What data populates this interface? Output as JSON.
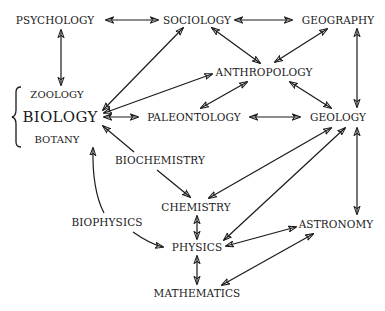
{
  "diagram": {
    "caption_partial": "",
    "nodes": [
      {
        "id": "psychology",
        "label": "PSYCHOLOGY",
        "x": 55,
        "y": 20
      },
      {
        "id": "sociology",
        "label": "SOCIOLOGY",
        "x": 214,
        "y": 20
      },
      {
        "id": "geography",
        "label": "GEOGRAPHY",
        "x": 346,
        "y": 20
      },
      {
        "id": "anthropology",
        "label": "ANTHROPOLOGY",
        "x": 278,
        "y": 72
      },
      {
        "id": "zoology",
        "label": "ZOOLOGY",
        "x": 60,
        "y": 95
      },
      {
        "id": "biology",
        "label": "BIOLOGY",
        "x": 60,
        "y": 117
      },
      {
        "id": "botany",
        "label": "BOTANY",
        "x": 60,
        "y": 139
      },
      {
        "id": "paleontology",
        "label": "PALEONTOLOGY",
        "x": 218,
        "y": 117
      },
      {
        "id": "geology",
        "label": "GEOLOGY",
        "x": 355,
        "y": 117
      },
      {
        "id": "biochemistry",
        "label": "BIOCHEMISTRY",
        "x": 161,
        "y": 160
      },
      {
        "id": "chemistry",
        "label": "CHEMISTRY",
        "x": 197,
        "y": 207
      },
      {
        "id": "biophysics",
        "label": "BIOPHYSICS",
        "x": 107,
        "y": 222
      },
      {
        "id": "astronomy",
        "label": "ASTRONOMY",
        "x": 336,
        "y": 224
      },
      {
        "id": "physics",
        "label": "PHYSICS",
        "x": 197,
        "y": 247
      },
      {
        "id": "mathematics",
        "label": "MATHEMATICS",
        "x": 197,
        "y": 293
      }
    ],
    "edges": [
      {
        "from": "psychology",
        "to": "sociology",
        "type": "bidirectional"
      },
      {
        "from": "sociology",
        "to": "geography",
        "type": "bidirectional"
      },
      {
        "from": "psychology",
        "to": "biology",
        "type": "bidirectional"
      },
      {
        "from": "sociology",
        "to": "biology",
        "type": "bidirectional"
      },
      {
        "from": "sociology",
        "to": "anthropology",
        "type": "bidirectional"
      },
      {
        "from": "geography",
        "to": "anthropology",
        "type": "bidirectional"
      },
      {
        "from": "anthropology",
        "to": "biology",
        "type": "bidirectional"
      },
      {
        "from": "anthropology",
        "to": "paleontology",
        "type": "bidirectional"
      },
      {
        "from": "anthropology",
        "to": "geology",
        "type": "bidirectional"
      },
      {
        "from": "geography",
        "to": "geology",
        "type": "directed"
      },
      {
        "from": "biology",
        "to": "paleontology",
        "type": "bidirectional"
      },
      {
        "from": "paleontology",
        "to": "geology",
        "type": "bidirectional"
      },
      {
        "from": "biochemistry",
        "to": "biology",
        "type": "directed"
      },
      {
        "from": "biochemistry",
        "to": "chemistry",
        "type": "directed"
      },
      {
        "from": "geology",
        "to": "chemistry",
        "type": "bidirectional"
      },
      {
        "from": "geology",
        "to": "physics",
        "type": "bidirectional"
      },
      {
        "from": "geology",
        "to": "astronomy",
        "type": "bidirectional"
      },
      {
        "from": "biophysics",
        "to": "biology",
        "type": "directed"
      },
      {
        "from": "biophysics",
        "to": "physics",
        "type": "directed"
      },
      {
        "from": "chemistry",
        "to": "physics",
        "type": "bidirectional"
      },
      {
        "from": "physics",
        "to": "astronomy",
        "type": "bidirectional"
      },
      {
        "from": "physics",
        "to": "mathematics",
        "type": "bidirectional"
      },
      {
        "from": "mathematics",
        "to": "astronomy",
        "type": "bidirectional"
      }
    ],
    "brace": {
      "group": [
        "zoology",
        "biology",
        "botany"
      ]
    }
  }
}
